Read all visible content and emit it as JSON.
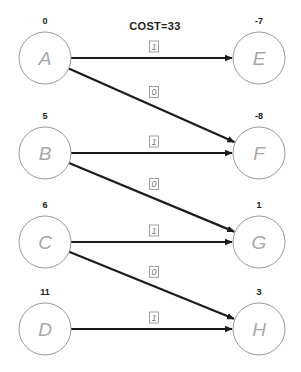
{
  "title": "COST=33",
  "colors": {
    "edge": "#1c1c1c",
    "node_stroke": "#9a9a9a",
    "node_label": "#a8a8a8",
    "text": "#222222"
  },
  "nodes": [
    {
      "id": "A",
      "label": "A",
      "potential": "0",
      "cx": 45,
      "cy": 58
    },
    {
      "id": "B",
      "label": "B",
      "potential": "5",
      "cx": 45,
      "cy": 153
    },
    {
      "id": "C",
      "label": "C",
      "potential": "6",
      "cx": 45,
      "cy": 242
    },
    {
      "id": "D",
      "label": "D",
      "potential": "11",
      "cx": 45,
      "cy": 329
    },
    {
      "id": "E",
      "label": "E",
      "potential": "-7",
      "cx": 259,
      "cy": 58
    },
    {
      "id": "F",
      "label": "F",
      "potential": "-8",
      "cx": 259,
      "cy": 153
    },
    {
      "id": "G",
      "label": "G",
      "potential": "1",
      "cx": 259,
      "cy": 242
    },
    {
      "id": "H",
      "label": "H",
      "potential": "3",
      "cx": 259,
      "cy": 329
    }
  ],
  "node_radius": 26,
  "edges": [
    {
      "from": "A",
      "to": "E",
      "label": "1"
    },
    {
      "from": "A",
      "to": "F",
      "label": "0"
    },
    {
      "from": "B",
      "to": "F",
      "label": "1"
    },
    {
      "from": "B",
      "to": "G",
      "label": "0"
    },
    {
      "from": "C",
      "to": "G",
      "label": "1"
    },
    {
      "from": "C",
      "to": "H",
      "label": "0"
    },
    {
      "from": "D",
      "to": "H",
      "label": "1"
    }
  ]
}
